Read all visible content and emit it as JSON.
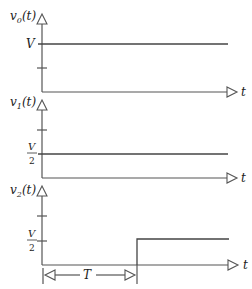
{
  "figure": {
    "panels": [
      {
        "y_label_base": "v",
        "y_label_sub": "0",
        "y_label_arg": "(t)",
        "x_label": "t",
        "level_label": "V",
        "level_label_den": "",
        "signal": "constant V"
      },
      {
        "y_label_base": "v",
        "y_label_sub": "1",
        "y_label_arg": "(t)",
        "x_label": "t",
        "level_label": "V",
        "level_label_den": "2",
        "signal": "constant V/2"
      },
      {
        "y_label_base": "v",
        "y_label_sub": "2",
        "y_label_arg": "(t)",
        "x_label": "t",
        "level_label": "V",
        "level_label_den": "2",
        "signal": "step to V/2 at t = T",
        "delay_label": "T"
      }
    ]
  },
  "colors": {
    "line": "#444444",
    "axis": "#555555",
    "text": "#222222"
  }
}
